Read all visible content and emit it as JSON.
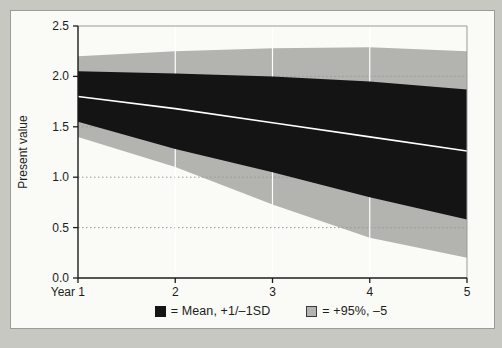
{
  "figure": {
    "page_background": "#c8c8c3",
    "panel_background": "#fafaf6",
    "panel_border": "#9b9b97"
  },
  "chart_data": {
    "type": "area",
    "title": "",
    "ylabel": "Present value",
    "xlabel": "",
    "x": [
      1,
      2,
      3,
      4,
      5
    ],
    "x_tick_labels": [
      "Year 1",
      "2",
      "3",
      "4",
      "5"
    ],
    "y_ticks": [
      0.0,
      0.5,
      1.0,
      1.5,
      2.0,
      2.5
    ],
    "y_tick_labels": [
      "0.0",
      "0.5",
      "1.0",
      "1.5",
      "2.0",
      "2.5"
    ],
    "ylim": [
      0,
      2.5
    ],
    "series": [
      {
        "name": "95th percentile (gray band top)",
        "values": [
          2.2,
          2.25,
          2.28,
          2.29,
          2.25
        ]
      },
      {
        "name": "Mean +1SD (black band top)",
        "values": [
          2.05,
          2.03,
          2.0,
          1.95,
          1.87
        ]
      },
      {
        "name": "Mean (white line)",
        "values": [
          1.8,
          1.68,
          1.54,
          1.4,
          1.26
        ]
      },
      {
        "name": "Mean -1SD (black band bottom)",
        "values": [
          1.55,
          1.28,
          1.05,
          0.8,
          0.58
        ]
      },
      {
        "name": "5th percentile (gray band bottom)",
        "values": [
          1.4,
          1.1,
          0.73,
          0.4,
          0.2
        ]
      }
    ],
    "grid": {
      "horizontal_dotted_at": [
        0.5,
        1.0,
        1.5,
        2.0
      ],
      "vertical_white_at_years": [
        2,
        3,
        4
      ]
    },
    "legend": [
      {
        "swatch_color": "#141414",
        "label": "= Mean, +1/–1SD"
      },
      {
        "swatch_color": "#b3b3b0",
        "label": "= +95%, –5"
      }
    ],
    "colors": {
      "sd_band": "#141414",
      "percentile_band": "#b3b3b0",
      "mean_line": "#ffffff",
      "axis": "#1c1c1c",
      "dotted_grid": "#98989a",
      "frame": "#9b9b97",
      "vertical_grid": "#ffffff"
    },
    "legend_position": "bottom-center",
    "grid_on": true
  }
}
